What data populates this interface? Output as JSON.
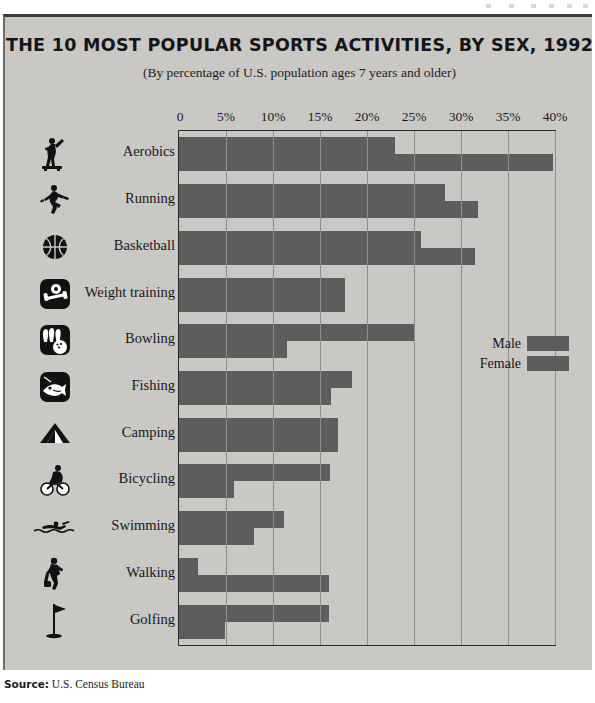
{
  "title": "THE 10 MOST POPULAR SPORTS ACTIVITIES, BY SEX, 1992",
  "subtitle": "(By percentage of U.S. population ages 7 years and older)",
  "source": {
    "label": "Source:",
    "text": "U.S. Census Bureau"
  },
  "legend": {
    "items": [
      {
        "label": "Male",
        "color": "#5d5d5d"
      },
      {
        "label": "Female",
        "color": "#5d5d5d"
      }
    ]
  },
  "icons": [
    "aerobics-icon",
    "running-icon",
    "basketball-icon",
    "weight-training-icon",
    "bowling-icon",
    "fishing-icon",
    "camping-icon",
    "bicycling-icon",
    "swimming-icon",
    "walking-icon",
    "golfing-icon"
  ],
  "chart_data": {
    "type": "bar",
    "orientation": "horizontal",
    "title": "THE 10 MOST POPULAR SPORTS ACTIVITIES, BY SEX, 1992",
    "subtitle": "(By percentage of U.S. population ages 7 years and older)",
    "xlabel": "",
    "ylabel": "",
    "xlim": [
      0,
      40
    ],
    "xticks": [
      0,
      5,
      10,
      15,
      20,
      25,
      30,
      35,
      40
    ],
    "xticklabels": [
      "0",
      "5%",
      "10%",
      "15%",
      "20%",
      "25%",
      "30%",
      "35%",
      "40%"
    ],
    "grid": true,
    "legend_position": "middle-right",
    "categories": [
      "Aerobics",
      "Running",
      "Basketball",
      "Weight training",
      "Bowling",
      "Fishing",
      "Camping",
      "Bicycling",
      "Swimming",
      "Walking",
      "Golfing"
    ],
    "series": [
      {
        "name": "Male",
        "color": "#5d5d5d",
        "values": [
          23.0,
          28.3,
          25.7,
          17.7,
          25.1,
          18.4,
          16.9,
          16.1,
          11.2,
          2.0,
          16.0
        ]
      },
      {
        "name": "Female",
        "color": "#5d5d5d",
        "values": [
          39.8,
          31.8,
          31.5,
          17.7,
          11.5,
          16.2,
          16.9,
          5.9,
          8.0,
          16.0,
          4.9
        ]
      }
    ]
  }
}
